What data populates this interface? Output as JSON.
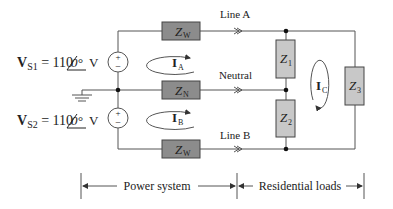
{
  "diagram": {
    "type": "circuit",
    "sources": [
      {
        "id": "VS1",
        "symbol": "V",
        "subscript": "S1",
        "equals": " = 110",
        "angle": "0°",
        "unit": " V",
        "plus": "+",
        "minus": "−"
      },
      {
        "id": "VS2",
        "symbol": "V",
        "subscript": "S2",
        "equals": " = 110",
        "angle": "0°",
        "unit": " V",
        "plus": "+",
        "minus": "−"
      }
    ],
    "impedances": {
      "zw_top": {
        "main": "Z",
        "sub": "W"
      },
      "zn": {
        "main": "Z",
        "sub": "N"
      },
      "zw_bottom": {
        "main": "Z",
        "sub": "W"
      },
      "z1": {
        "main": "Z",
        "sub": "1"
      },
      "z2": {
        "main": "Z",
        "sub": "2"
      },
      "z3": {
        "main": "Z",
        "sub": "3"
      }
    },
    "lines": {
      "a": "Line A",
      "neutral": "Neutral",
      "b": "Line B"
    },
    "currents": {
      "ia": {
        "main": "I",
        "sub": "A"
      },
      "ib": {
        "main": "I",
        "sub": "B"
      },
      "ic": {
        "main": "I",
        "sub": "C"
      }
    },
    "sections": {
      "power": "Power system",
      "loads": "Residential loads"
    },
    "colors": {
      "wire": "#555555",
      "line_impedance_fill": "#8c8c8c",
      "load_impedance_fill": "#c8c8c8"
    }
  }
}
